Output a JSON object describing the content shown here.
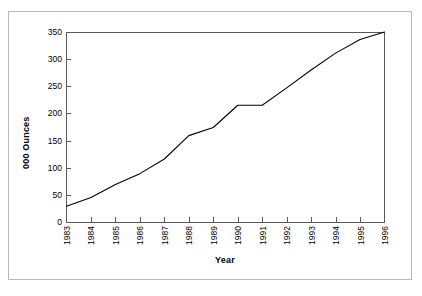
{
  "chart_data": {
    "type": "line",
    "title": "",
    "subtitle": "",
    "xlabel": "Year",
    "ylabel": "000 Ounces",
    "x": [
      1983,
      1984,
      1985,
      1986,
      1987,
      1988,
      1989,
      1990,
      1991,
      1992,
      1993,
      1994,
      1995,
      1996
    ],
    "categories": [
      "1983",
      "1984",
      "1985",
      "1986",
      "1987",
      "1988",
      "1989",
      "1990",
      "1991",
      "1992",
      "1993",
      "1994",
      "1995",
      "1996"
    ],
    "values": [
      30,
      46,
      70,
      90,
      117,
      160,
      175,
      216,
      216,
      248,
      281,
      312,
      337,
      351
    ],
    "series": [
      {
        "name": "000 Ounces",
        "values": [
          30,
          46,
          70,
          90,
          117,
          160,
          175,
          216,
          216,
          248,
          281,
          312,
          337,
          351
        ],
        "color": "#000000"
      }
    ],
    "xlim": [
      1983,
      1996
    ],
    "ylim": [
      0,
      350
    ],
    "ytick_labels": [
      "0",
      "50",
      "100",
      "150",
      "200",
      "250",
      "300",
      "350"
    ],
    "ytick_values": [
      0,
      50,
      100,
      150,
      200,
      250,
      300,
      350
    ],
    "xtick_labels": [
      "1983",
      "1984",
      "1985",
      "1986",
      "1987",
      "1988",
      "1989",
      "1990",
      "1991",
      "1992",
      "1993",
      "1994",
      "1995",
      "1996"
    ],
    "grid": false,
    "legend": "none",
    "line_color": "#000000",
    "axis_color": "#595959",
    "frame_color": "#b9b9b9",
    "background": "#ffffff"
  }
}
